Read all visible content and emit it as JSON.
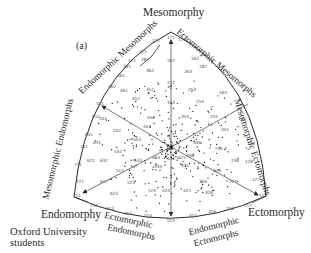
{
  "figure": {
    "panel_label": "(a)",
    "caption_line1": "Oxford University",
    "caption_line2": "students",
    "vertices": {
      "top": "Mesomorphy",
      "left": "Endomorphy",
      "right": "Ectomorphy"
    },
    "regions": {
      "endomorphic_mesomorphs": "Endomorphic Mesomorphs",
      "ectomorphic_mesomorphs": "Ectomorphic Mesomorphs",
      "mesomorphic_endomorphs": "Mesomorphic Endomorphs",
      "mesomorphic_ectomorphs": "Mesomorphic Ectomorphs",
      "ectomorphic_endomorphs_1": "Ectomorphic",
      "ectomorphic_endomorphs_2": "Endomorphs",
      "endomorphic_ectomorphs_1": "Endomorphic",
      "endomorphic_ectomorphs_2": "Ectomorphs"
    },
    "colors": {
      "ink": "#2a2a2a",
      "axis": "#555555",
      "dot": "#1a1a1a",
      "code": "#555555"
    }
  },
  "chart_data": {
    "type": "scatter",
    "subtitle": "Oxford University students",
    "panel": "(a)",
    "axes": [
      "Mesomorphy",
      "Endomorphy",
      "Ectomorphy"
    ],
    "somatotype_codes": [
      {
        "code": "171",
        "x": 171,
        "y": 39
      },
      {
        "code": "172",
        "x": 182,
        "y": 41
      },
      {
        "code": "271",
        "x": 156,
        "y": 42
      },
      {
        "code": "371",
        "x": 143,
        "y": 53
      },
      {
        "code": "281",
        "x": 145,
        "y": 61
      },
      {
        "code": "471",
        "x": 132,
        "y": 62
      },
      {
        "code": "381",
        "x": 127,
        "y": 68
      },
      {
        "code": "162",
        "x": 195,
        "y": 60
      },
      {
        "code": "262",
        "x": 171,
        "y": 62
      },
      {
        "code": "182",
        "x": 203,
        "y": 68
      },
      {
        "code": "362",
        "x": 150,
        "y": 72
      },
      {
        "code": "263",
        "x": 188,
        "y": 73
      },
      {
        "code": "461",
        "x": 121,
        "y": 77
      },
      {
        "code": "562",
        "x": 112,
        "y": 88
      },
      {
        "code": "252",
        "x": 171,
        "y": 84
      },
      {
        "code": "461",
        "x": 124,
        "y": 92
      },
      {
        "code": "352",
        "x": 150,
        "y": 91
      },
      {
        "code": "253",
        "x": 192,
        "y": 91
      },
      {
        "code": "164",
        "x": 223,
        "y": 94
      },
      {
        "code": "452",
        "x": 136,
        "y": 100
      },
      {
        "code": "353",
        "x": 171,
        "y": 104
      },
      {
        "code": "254",
        "x": 200,
        "y": 103
      },
      {
        "code": "551",
        "x": 100,
        "y": 105
      },
      {
        "code": "651",
        "x": 96,
        "y": 118
      },
      {
        "code": "541",
        "x": 103,
        "y": 120
      },
      {
        "code": "453",
        "x": 151,
        "y": 119
      },
      {
        "code": "354",
        "x": 185,
        "y": 118
      },
      {
        "code": "255",
        "x": 214,
        "y": 118
      },
      {
        "code": "145",
        "x": 242,
        "y": 120
      },
      {
        "code": "443",
        "x": 147,
        "y": 128
      },
      {
        "code": "542",
        "x": 117,
        "y": 132
      },
      {
        "code": "345",
        "x": 225,
        "y": 131
      },
      {
        "code": "641",
        "x": 89,
        "y": 136
      },
      {
        "code": "543",
        "x": 137,
        "y": 141
      },
      {
        "code": "631",
        "x": 97,
        "y": 144
      },
      {
        "code": "444",
        "x": 170,
        "y": 147
      },
      {
        "code": "346",
        "x": 197,
        "y": 144
      },
      {
        "code": "741",
        "x": 84,
        "y": 148
      },
      {
        "code": "136",
        "x": 251,
        "y": 145
      },
      {
        "code": "532",
        "x": 118,
        "y": 153
      },
      {
        "code": "235",
        "x": 219,
        "y": 150
      },
      {
        "code": "433",
        "x": 156,
        "y": 159
      },
      {
        "code": "621",
        "x": 91,
        "y": 162
      },
      {
        "code": "632",
        "x": 104,
        "y": 162
      },
      {
        "code": "533",
        "x": 138,
        "y": 162
      },
      {
        "code": "425",
        "x": 182,
        "y": 159
      },
      {
        "code": "336",
        "x": 190,
        "y": 157
      },
      {
        "code": "238",
        "x": 235,
        "y": 162
      },
      {
        "code": "128",
        "x": 249,
        "y": 163
      },
      {
        "code": "731",
        "x": 78,
        "y": 166
      },
      {
        "code": "434",
        "x": 171,
        "y": 160
      },
      {
        "code": "534",
        "x": 158,
        "y": 168
      },
      {
        "code": "435",
        "x": 185,
        "y": 167
      },
      {
        "code": "512",
        "x": 120,
        "y": 172
      },
      {
        "code": "226",
        "x": 217,
        "y": 172
      },
      {
        "code": "721",
        "x": 80,
        "y": 183
      },
      {
        "code": "612",
        "x": 104,
        "y": 183
      },
      {
        "code": "523",
        "x": 131,
        "y": 184
      },
      {
        "code": "326",
        "x": 203,
        "y": 183
      },
      {
        "code": "227",
        "x": 233,
        "y": 183
      },
      {
        "code": "127",
        "x": 256,
        "y": 181
      },
      {
        "code": "623",
        "x": 114,
        "y": 195
      },
      {
        "code": "524",
        "x": 152,
        "y": 192
      },
      {
        "code": "424",
        "x": 166,
        "y": 192
      },
      {
        "code": "425",
        "x": 187,
        "y": 192
      },
      {
        "code": "326",
        "x": 209,
        "y": 194
      },
      {
        "code": "711",
        "x": 77,
        "y": 197
      },
      {
        "code": "117",
        "x": 263,
        "y": 197
      },
      {
        "code": "712",
        "x": 94,
        "y": 207
      },
      {
        "code": "613",
        "x": 110,
        "y": 210
      },
      {
        "code": "613",
        "x": 128,
        "y": 215
      },
      {
        "code": "514",
        "x": 148,
        "y": 217
      },
      {
        "code": "515",
        "x": 171,
        "y": 222
      },
      {
        "code": "415",
        "x": 193,
        "y": 217
      },
      {
        "code": "316",
        "x": 212,
        "y": 213
      },
      {
        "code": "216",
        "x": 230,
        "y": 210
      },
      {
        "code": "217",
        "x": 248,
        "y": 207
      }
    ]
  }
}
